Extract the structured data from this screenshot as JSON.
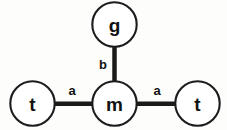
{
  "diagram": {
    "background_color": "#fdfdfc",
    "stroke_color": "#1c1c1c",
    "edge_color": "#1b1b1b",
    "label_color": "#111111",
    "nodes": [
      {
        "id": "g",
        "label": "g",
        "cx": 114.5,
        "cy": 24.5,
        "r": 22.2
      },
      {
        "id": "m",
        "label": "m",
        "cx": 114.5,
        "cy": 103.5,
        "r": 22.2
      },
      {
        "id": "t_left",
        "label": "t",
        "cx": 32.5,
        "cy": 103.5,
        "r": 22.2
      },
      {
        "id": "t_right",
        "label": "t",
        "cx": 197.5,
        "cy": 103.5,
        "r": 22.2
      }
    ],
    "edges": [
      {
        "id": "edge-g-m",
        "from": "g",
        "to": "m",
        "label": "b",
        "label_x": 103,
        "label_y": 64,
        "x1": 114.5,
        "y1": 46.7,
        "x2": 114.5,
        "y2": 81.3
      },
      {
        "id": "edge-tleft-m",
        "from": "t_left",
        "to": "m",
        "label": "a",
        "label_x": 72,
        "label_y": 90,
        "x1": 54.7,
        "y1": 103.7,
        "x2": 92.3,
        "y2": 103.7
      },
      {
        "id": "edge-m-tright",
        "from": "m",
        "to": "t_right",
        "label": "a",
        "label_x": 157,
        "label_y": 90,
        "x1": 136.7,
        "y1": 103.7,
        "x2": 175.3,
        "y2": 103.7
      }
    ]
  }
}
